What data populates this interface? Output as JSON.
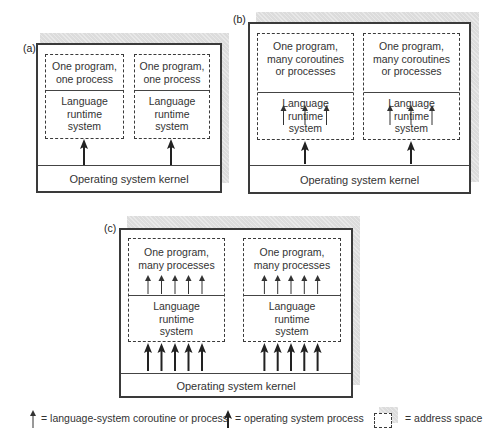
{
  "panels": {
    "a": {
      "label": "(a)",
      "kernel": "Operating system kernel",
      "spaces": [
        {
          "program": [
            "One program,",
            "one process"
          ],
          "runtime": [
            "Language",
            "runtime",
            "system"
          ],
          "coroutines": 0,
          "os_processes": 1
        },
        {
          "program": [
            "One program,",
            "one process"
          ],
          "runtime": [
            "Language",
            "runtime",
            "system"
          ],
          "coroutines": 0,
          "os_processes": 1
        }
      ]
    },
    "b": {
      "label": "(b)",
      "kernel": "Operating system kernel",
      "spaces": [
        {
          "program": [
            "One program,",
            "many coroutines",
            "or processes"
          ],
          "runtime": [
            "Language",
            "runtime",
            "system"
          ],
          "coroutines": 3,
          "os_processes": 1
        },
        {
          "program": [
            "One program,",
            "many coroutines",
            "or processes"
          ],
          "runtime": [
            "Language",
            "runtime",
            "system"
          ],
          "coroutines": 3,
          "os_processes": 1
        }
      ]
    },
    "c": {
      "label": "(c)",
      "kernel": "Operating system kernel",
      "spaces": [
        {
          "program": [
            "One program,",
            "many processes"
          ],
          "runtime": [
            "Language",
            "runtime",
            "system"
          ],
          "coroutines": 5,
          "os_processes": 5
        },
        {
          "program": [
            "One program,",
            "many processes"
          ],
          "runtime": [
            "Language",
            "runtime",
            "system"
          ],
          "coroutines": 5,
          "os_processes": 5
        }
      ]
    }
  },
  "legend": {
    "coroutine": "= language-system coroutine or process",
    "os_process": "= operating system process",
    "address_space": "= address space"
  },
  "colors": {
    "line": "#3a3a3a",
    "shadow": "#dcdcdc"
  }
}
